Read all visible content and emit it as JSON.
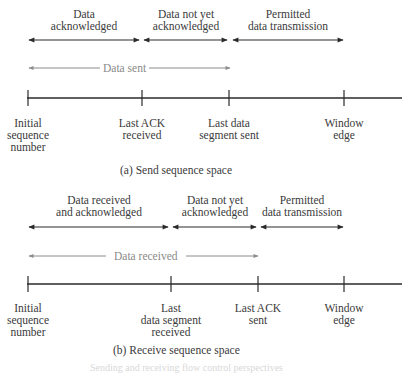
{
  "colors": {
    "line": "#2a2a2a",
    "gray_arrow": "#8c8c8c",
    "text": "#3a3a3a"
  },
  "send": {
    "regions": [
      {
        "label_line1": "Data",
        "label_line2": "acknowledged",
        "x1": 28,
        "x2": 140
      },
      {
        "label_line1": "Data not yet",
        "label_line2": "acknowledged",
        "x1": 143,
        "x2": 228
      },
      {
        "label_line1": "Permitted",
        "label_line2": "data transmission",
        "x1": 232,
        "x2": 343
      }
    ],
    "span_label": "Data sent",
    "ticks": [
      {
        "x": 28,
        "label": "Initial\nsequence\nnumber"
      },
      {
        "x": 142,
        "label": "Last ACK\nreceived"
      },
      {
        "x": 229,
        "label": "Last data\nsegment sent"
      },
      {
        "x": 344,
        "label": "Window\nedge"
      }
    ],
    "caption": "(a) Send sequence space"
  },
  "receive": {
    "regions": [
      {
        "label_line1": "Data received",
        "label_line2": "and acknowledged",
        "x1": 28,
        "x2": 169
      },
      {
        "label_line1": "Data not yet",
        "label_line2": "acknowledged",
        "x1": 172,
        "x2": 257
      },
      {
        "label_line1": "Permitted",
        "label_line2": "data transmission",
        "x1": 260,
        "x2": 343
      }
    ],
    "span_label": "Data received",
    "ticks": [
      {
        "x": 28,
        "label": "Initial\nsequence\nnumber"
      },
      {
        "x": 171,
        "label": "Last\ndata segment\nreceived"
      },
      {
        "x": 258,
        "label": "Last ACK\nsent"
      },
      {
        "x": 344,
        "label": "Window\nedge"
      }
    ],
    "caption": "(b) Receive sequence space"
  },
  "footer": "Sending and receiving flow control perspectives"
}
